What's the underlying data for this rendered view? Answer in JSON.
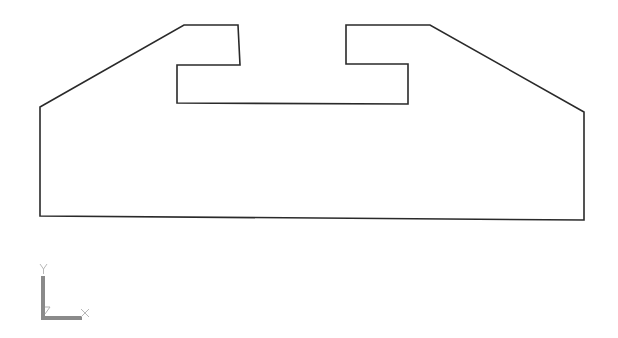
{
  "drawing": {
    "type": "cad-profile",
    "stroke_color": "#2a2a2a",
    "background": "#ffffff",
    "profile_outline": [
      [
        40,
        107
      ],
      [
        184,
        25
      ],
      [
        238,
        25
      ],
      [
        240,
        65
      ],
      [
        177,
        65
      ],
      [
        177,
        103
      ],
      [
        408,
        104
      ],
      [
        408,
        64
      ],
      [
        346,
        64
      ],
      [
        346,
        25
      ],
      [
        430,
        25
      ],
      [
        584,
        112
      ],
      [
        584,
        220
      ],
      [
        40,
        216
      ]
    ]
  },
  "ucs_icon": {
    "x_label": "X",
    "y_label": "Y",
    "color": "#8a8a8a"
  }
}
